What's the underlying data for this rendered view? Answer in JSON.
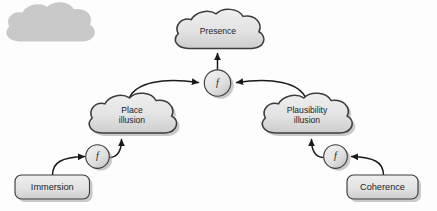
{
  "diagram": {
    "background_color": "#fdfdfd",
    "node_fill_light": "#ececec",
    "node_fill_dark": "#cfcfcf",
    "node_stroke": "#3d3d3d",
    "edge_color": "#1a1a1a",
    "shadow_color": "#9a9a9a",
    "nodes": {
      "presence": {
        "label": "Presence",
        "shape": "cloud"
      },
      "place_illusion": {
        "label_line1": "Place",
        "label_line2": "illusion",
        "shape": "cloud"
      },
      "plausibility_illusion": {
        "label_line1": "Plausibility",
        "label_line2": "illusion",
        "shape": "cloud"
      },
      "immersion": {
        "label": "Immersion",
        "shape": "rounded-rect"
      },
      "coherence": {
        "label": "Coherence",
        "shape": "rounded-rect"
      },
      "function_top": {
        "label": "f",
        "shape": "circle"
      },
      "function_left": {
        "label": "f",
        "shape": "circle"
      },
      "function_right": {
        "label": "f",
        "shape": "circle"
      }
    },
    "edges": [
      {
        "from": "function_top",
        "to": "presence"
      },
      {
        "from": "place_illusion",
        "to": "function_top"
      },
      {
        "from": "plausibility_illusion",
        "to": "function_top"
      },
      {
        "from": "function_left",
        "to": "place_illusion"
      },
      {
        "from": "function_right",
        "to": "plausibility_illusion"
      },
      {
        "from": "immersion",
        "to": "function_left"
      },
      {
        "from": "coherence",
        "to": "function_right"
      }
    ]
  }
}
